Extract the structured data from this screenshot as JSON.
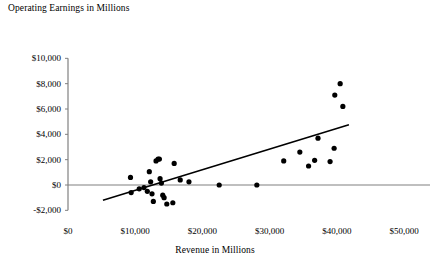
{
  "chart_data": {
    "type": "scatter",
    "title": "Operating Earnings in Millions",
    "xlabel": "Revenue in Millions",
    "ylabel": "Operating Earnings in Millions",
    "xlim": [
      0,
      50000
    ],
    "ylim": [
      -2000,
      10000
    ],
    "grid": false,
    "legend": null,
    "x_ticks": [
      0,
      10000,
      20000,
      30000,
      40000,
      50000
    ],
    "x_tick_labels": [
      "$0",
      "$10,000",
      "$20,000",
      "$30,000",
      "$40,000",
      "$50,000"
    ],
    "y_ticks": [
      -2000,
      0,
      2000,
      4000,
      6000,
      8000,
      10000
    ],
    "y_tick_labels": [
      "-$2,000",
      "$0",
      "$2,000",
      "$4,000",
      "$6,000",
      "$8,000",
      "$10,000"
    ],
    "marker_color": "#000000",
    "marker_size": 4,
    "axis_color": "#808080",
    "zero_line": 0,
    "points": [
      {
        "x": 9300,
        "y": 600
      },
      {
        "x": 9400,
        "y": -600
      },
      {
        "x": 10600,
        "y": -300
      },
      {
        "x": 11300,
        "y": -200
      },
      {
        "x": 11800,
        "y": -500
      },
      {
        "x": 12100,
        "y": 1050
      },
      {
        "x": 12300,
        "y": 250
      },
      {
        "x": 12500,
        "y": -700
      },
      {
        "x": 12700,
        "y": -1300
      },
      {
        "x": 13100,
        "y": 1900
      },
      {
        "x": 13400,
        "y": 2050
      },
      {
        "x": 13600,
        "y": 2050
      },
      {
        "x": 13700,
        "y": 500
      },
      {
        "x": 13900,
        "y": 150
      },
      {
        "x": 14100,
        "y": -800
      },
      {
        "x": 14300,
        "y": -1000
      },
      {
        "x": 14700,
        "y": -1500
      },
      {
        "x": 15600,
        "y": -1400
      },
      {
        "x": 15800,
        "y": 1700
      },
      {
        "x": 16700,
        "y": 400
      },
      {
        "x": 18000,
        "y": 250
      },
      {
        "x": 22500,
        "y": 0
      },
      {
        "x": 28100,
        "y": 0
      },
      {
        "x": 32100,
        "y": 1900
      },
      {
        "x": 34500,
        "y": 2600
      },
      {
        "x": 35800,
        "y": 1500
      },
      {
        "x": 36700,
        "y": 1950
      },
      {
        "x": 37200,
        "y": 3700
      },
      {
        "x": 39000,
        "y": 1850
      },
      {
        "x": 39600,
        "y": 2900
      },
      {
        "x": 39700,
        "y": 7100
      },
      {
        "x": 40500,
        "y": 8000
      },
      {
        "x": 40900,
        "y": 6200
      }
    ],
    "trend_line": {
      "x_start": 5200,
      "y_start": -1200,
      "x_end": 41800,
      "y_end": 4750,
      "color": "#000000"
    }
  }
}
